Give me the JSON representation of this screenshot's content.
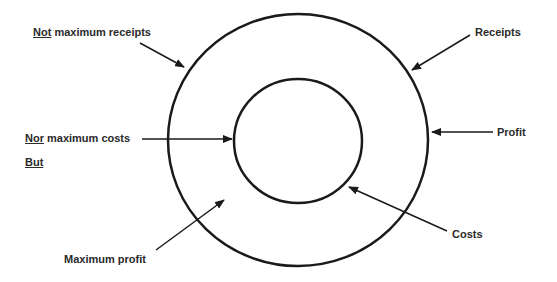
{
  "diagram": {
    "type": "concentric-circles",
    "outer_circle": {
      "represents": "Receipts",
      "cx": 298,
      "cy": 140,
      "rx": 130,
      "ry": 126
    },
    "inner_circle": {
      "represents": "Costs",
      "cx": 298,
      "cy": 141,
      "rx": 64,
      "ry": 62
    },
    "ring": {
      "represents": "Profit"
    }
  },
  "labels": {
    "not_max_receipts": {
      "emph": "Not",
      "rest": " maximum receipts"
    },
    "nor_max_costs": {
      "emph": "Nor",
      "rest": " maximum costs"
    },
    "but": {
      "emph": "But"
    },
    "maximum_profit": "Maximum profit",
    "receipts": "Receipts",
    "profit": "Profit",
    "costs": "Costs"
  },
  "colors": {
    "stroke": "#1a1a1a",
    "text": "#2a2a2a",
    "background": "#ffffff"
  }
}
